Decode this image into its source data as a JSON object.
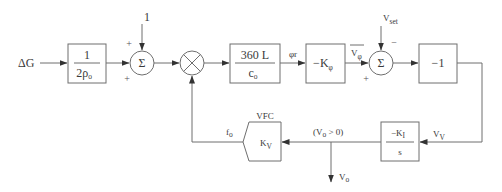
{
  "diagram": {
    "type": "control-loop-block-diagram",
    "input": {
      "label": "ΔG"
    },
    "blocks": [
      {
        "id": "gain-inv-2rho",
        "numerator": "1",
        "denominator": "2ρ",
        "denominator_sub": "o"
      },
      {
        "id": "gain-360L-co",
        "numerator": "360 L",
        "denominator": "c",
        "denominator_sub": "o"
      },
      {
        "id": "gain-neg-kphi",
        "label": "−K",
        "label_sub": "φ"
      },
      {
        "id": "gain-neg-one",
        "label": "−1"
      },
      {
        "id": "integrator-neg-ki",
        "numerator": "−K",
        "numerator_sub": "I",
        "denominator": "s"
      },
      {
        "id": "vfc",
        "title": "VFC",
        "label": "K",
        "label_sub": "V"
      }
    ],
    "junctions": [
      {
        "id": "sum1",
        "symbol": "Σ",
        "top_input": "1",
        "top_sign": "+",
        "left_sign": "+"
      },
      {
        "id": "multiplier",
        "symbol": "×"
      },
      {
        "id": "sum2",
        "symbol": "Σ",
        "top_input": "V",
        "top_input_sub": "set",
        "top_sign": "−",
        "left_sign": "+"
      }
    ],
    "signals": {
      "phi_r": "φr",
      "v_phi": "V",
      "v_phi_sub": "φ",
      "v_v": "V",
      "v_v_sub": "V",
      "f_o": "f",
      "f_o_sub": "o",
      "condition": "(V",
      "condition_sub": "o",
      "condition_tail": " > 0)",
      "output": "V",
      "output_sub": "o"
    }
  }
}
